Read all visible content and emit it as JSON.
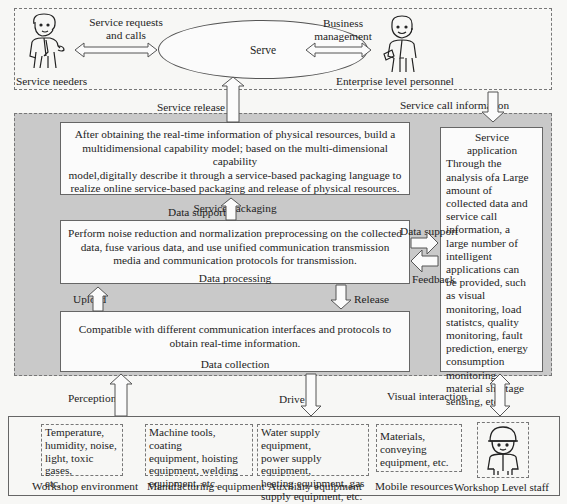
{
  "top_layer": {
    "actors": {
      "service_needers": "Service needers",
      "enterprise_personnel": "Enterprise level personnel"
    },
    "serve_node": "Serve",
    "arrows": {
      "service_requests": [
        "Service requests",
        "and calls"
      ],
      "business_management": [
        "Business",
        "management"
      ]
    }
  },
  "connectors": {
    "service_release": "Service release",
    "service_call_information": "Service call information",
    "data_support_up": "Data support",
    "data_support_right": "Data support",
    "feedback": "Feedback",
    "upload": "Upload",
    "release": "Release",
    "perception": "Perception",
    "drive": "Drive",
    "visual_interaction": "Visual interaction"
  },
  "layers": {
    "service_packaging": {
      "text": "After obtaining the real-time information of physical resources, build a multidimensional capability model; based on the multi-dimensional capability model,digitally describe it through a service-based packaging language to realize online service-based packaging and release of physical resources.",
      "lines": [
        "After obtaining the real-time information of physical resources, build a",
        "multidimensional capability model; based on the multi-dimensional capability",
        "model,digitally describe it through a service-based packaging language to",
        "realize online service-based packaging and release of physical resources."
      ],
      "title": "Service packaging"
    },
    "data_processing": {
      "lines": [
        "Perform noise reduction and normalization preprocessing on the collected",
        "data, fuse various data, and use unified communication transmission",
        "media and communication protocols for transmission."
      ],
      "title": "Data processing"
    },
    "data_collection": {
      "lines": [
        "Compatible with different communication interfaces and protocols to",
        "obtain real-time information."
      ],
      "title": "Data collection"
    }
  },
  "service_application": {
    "title_lines": [
      "Service",
      "application"
    ],
    "body_lines": [
      "Through the",
      "analysis ofa Large",
      "amount of",
      "collected data and",
      "service call",
      "information, a",
      "large number of",
      "intelligent",
      "applications can",
      "be provided, such",
      "as visual",
      "monitoring, load",
      "statistcs, quality",
      "monitoring, fault",
      "prediction, energy",
      "consumption",
      "monitoring,",
      "material shortage",
      "sensing, etc."
    ]
  },
  "physical_resources": [
    {
      "items_lines": [
        "Temperature,",
        "humidity, noise,",
        "light, toxic gases,",
        "etc."
      ],
      "caption": "Workshop environment"
    },
    {
      "items_lines": [
        "Machine tools, coating",
        "equipment, hoisting",
        "equipment, welding",
        "equipment, etc."
      ],
      "caption": "Manufacturing equipment"
    },
    {
      "items_lines": [
        "Water supply equipment,",
        "power supply equipment,",
        "heating equipment, gas",
        "supply equipment, etc."
      ],
      "caption": "Auxiliary equipment"
    },
    {
      "items_lines": [
        "Materials,",
        "conveying",
        "equipment, etc."
      ],
      "caption": "Mobile resources"
    },
    {
      "items_lines": [],
      "caption": "Workshop Level staff"
    }
  ],
  "colors": {
    "gray_zone": "#c9c9c9",
    "box_fill": "#fbfbfb",
    "stroke": "#555555",
    "caption_blue": "#a9c3de"
  }
}
